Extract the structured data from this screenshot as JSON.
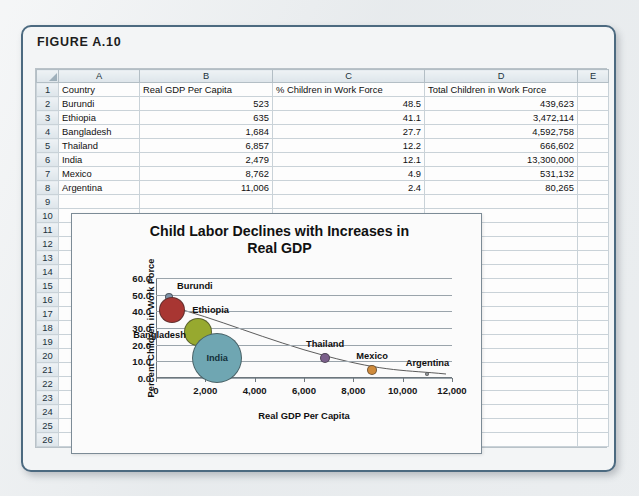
{
  "figure": {
    "label": "FIGURE A.10"
  },
  "spreadsheet": {
    "column_headers": [
      "",
      "A",
      "B",
      "C",
      "D",
      "E"
    ],
    "row_numbers": [
      "1",
      "2",
      "3",
      "4",
      "5",
      "6",
      "7",
      "8",
      "9",
      "10",
      "11",
      "12",
      "13",
      "14",
      "15",
      "16",
      "17",
      "18",
      "19",
      "20",
      "21",
      "22",
      "23",
      "24",
      "25",
      "26"
    ],
    "header_row": {
      "a": "Country",
      "b": "Real GDP Per Capita",
      "c": "% Children in Work Force",
      "d": "Total Children in Work Force",
      "e": ""
    },
    "rows": [
      {
        "row": "2",
        "country": "Burundi",
        "gdp": "523",
        "pct": "48.5",
        "total": "439,623"
      },
      {
        "row": "3",
        "country": "Ethiopia",
        "gdp": "635",
        "pct": "41.1",
        "total": "3,472,114"
      },
      {
        "row": "4",
        "country": "Bangladesh",
        "gdp": "1,684",
        "pct": "27.7",
        "total": "4,592,758"
      },
      {
        "row": "5",
        "country": "Thailand",
        "gdp": "6,857",
        "pct": "12.2",
        "total": "666,602"
      },
      {
        "row": "6",
        "country": "India",
        "gdp": "2,479",
        "pct": "12.1",
        "total": "13,300,000"
      },
      {
        "row": "7",
        "country": "Mexico",
        "gdp": "8,762",
        "pct": "4.9",
        "total": "531,132"
      },
      {
        "row": "8",
        "country": "Argentina",
        "gdp": "11,006",
        "pct": "2.4",
        "total": "80,265"
      }
    ]
  },
  "chart_data": {
    "type": "scatter",
    "title": "Child Labor Declines with Increases in Real GDP",
    "title_line1": "Child Labor Declines with Increases in",
    "title_line2": "Real GDP",
    "xlabel": "Real GDP Per Capita",
    "ylabel": "Percent Children in Work Force",
    "xlim": [
      0,
      12000
    ],
    "ylim": [
      0,
      60
    ],
    "xticks": [
      "0",
      "2,000",
      "4,000",
      "6,000",
      "8,000",
      "10,000",
      "12,000"
    ],
    "xtick_values": [
      0,
      2000,
      4000,
      6000,
      8000,
      10000,
      12000
    ],
    "yticks": [
      "0.0",
      "10.0",
      "20.0",
      "30.0",
      "40.0",
      "50.0",
      "60.0"
    ],
    "ytick_values": [
      0,
      10,
      20,
      30,
      40,
      50,
      60
    ],
    "grid": "horizontal",
    "legend": "none",
    "size_encodes": "Total Children in Work Force",
    "trendline": "power/decreasing fit curve",
    "points": [
      {
        "label": "Burundi",
        "x": 523,
        "y": 48.5,
        "size": 439623,
        "color": "#7e93a8",
        "radius_px": 4,
        "label_pos": "above-right",
        "label_inside": false
      },
      {
        "label": "Ethiopia",
        "x": 635,
        "y": 41.1,
        "size": 3472114,
        "color": "#a83632",
        "radius_px": 13,
        "label_pos": "right",
        "label_inside": false
      },
      {
        "label": "Bangladesh",
        "x": 1684,
        "y": 27.7,
        "size": 4592758,
        "color": "#97a92f",
        "radius_px": 14,
        "label_pos": "left",
        "label_inside": false
      },
      {
        "label": "India",
        "x": 2479,
        "y": 12.1,
        "size": 13300000,
        "color": "#6fa6b2",
        "radius_px": 25,
        "label_pos": "center",
        "label_inside": true
      },
      {
        "label": "Thailand",
        "x": 6857,
        "y": 12.2,
        "size": 666602,
        "color": "#7a5f8a",
        "radius_px": 5,
        "label_pos": "above",
        "label_inside": false
      },
      {
        "label": "Mexico",
        "x": 8762,
        "y": 4.9,
        "size": 531132,
        "color": "#cf8b3c",
        "radius_px": 5,
        "label_pos": "above",
        "label_inside": false
      },
      {
        "label": "Argentina",
        "x": 11006,
        "y": 2.4,
        "size": 80265,
        "color": "#9aa0a4",
        "radius_px": 2,
        "label_pos": "above",
        "label_inside": false
      }
    ]
  },
  "colors": {
    "frame_border": "#4c6a80",
    "page_background": "#e9ecee",
    "sheet_header": "#dde5ea",
    "gridline": "#9aa4ab"
  }
}
